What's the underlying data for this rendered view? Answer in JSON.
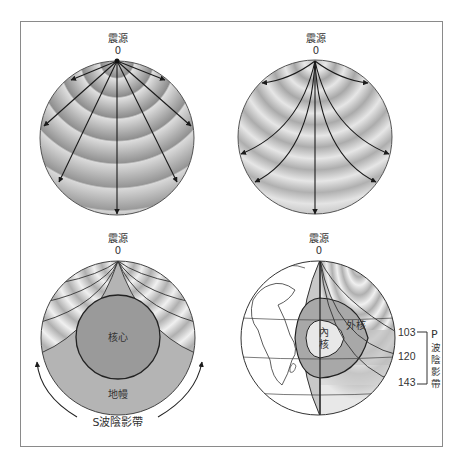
{
  "figure": {
    "panels": [
      {
        "id": "straight-rays",
        "source_label": "震源",
        "source_value": "0"
      },
      {
        "id": "curved-rays",
        "source_label": "震源",
        "source_value": "0"
      },
      {
        "id": "s-wave-shadow",
        "source_label": "震源",
        "source_value": "0",
        "core_label": "核心",
        "mantle_label": "地幔",
        "shadow_label": "S波陰影帶"
      },
      {
        "id": "p-wave-shadow",
        "source_label": "震源",
        "source_value": "0",
        "inner_core_label_line1": "內",
        "inner_core_label_line2": "核",
        "outer_core_label": "外核",
        "angles": [
          "103",
          "120",
          "143"
        ],
        "shadow_label_letter": "P",
        "shadow_label_chars": [
          "波",
          "陰",
          "影",
          "帶"
        ]
      }
    ],
    "colors": {
      "frame": "#8a8a8a",
      "ray": "#1a1a1a",
      "core": "#9a9a9a",
      "mantle": "#b4b4b4"
    }
  }
}
